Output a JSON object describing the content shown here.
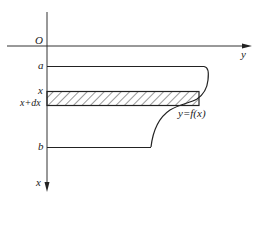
{
  "diagram": {
    "axes": {
      "origin_label": "O",
      "horizontal_axis_label": "y",
      "vertical_axis_label": "x"
    },
    "levels": {
      "a_label": "a",
      "x_label": "x",
      "x_dx_label": "x+dx",
      "b_label": "b"
    },
    "curve_label": "y=f(x)",
    "colors": {
      "stroke": "#222222",
      "background": "#ffffff"
    }
  }
}
